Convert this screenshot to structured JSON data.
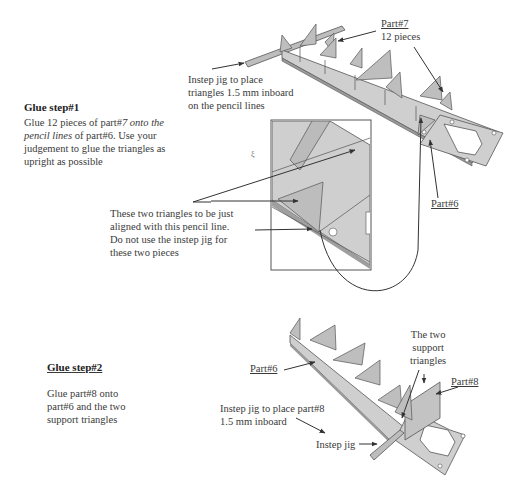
{
  "step1": {
    "title": "Glue step#1",
    "body_line1_a": "Glue 12 pieces of part#",
    "body_line1_b": "7 onto the",
    "body_line2_a": "pencil lines",
    "body_line2_b": " of part#6. Use your",
    "body_line3": "judgement to glue the triangles as",
    "body_line4": "upright as possible",
    "labels": {
      "jig_line1": "Instep jig to place",
      "jig_line2": "triangles 1.5 mm inboard",
      "jig_line3": "on the pencil lines",
      "part7": "Part#7",
      "part7_count": "12 pieces",
      "part6": "Part#6",
      "inset_note_line1": "These two triangles to be just",
      "inset_note_line2": "aligned with this pencil line.",
      "inset_note_line3": "Do not use the instep jig for",
      "inset_note_line4": "these two pieces"
    }
  },
  "step2": {
    "title": "Glue step#2",
    "body_line1": "Glue part#8 onto",
    "body_line2": "part#6 and the two",
    "body_line3": "support triangles",
    "labels": {
      "part6": "Part#6",
      "support_line1": "The two",
      "support_line2": "support",
      "support_line3": "triangles",
      "part8": "Part#8",
      "jig_line1": "Instep jig to place part#8",
      "jig_line2": "1.5 mm inboard",
      "instep_jig": "Instep jig"
    }
  },
  "colors": {
    "part_fill": "#c9c9c9",
    "part_edge": "#555555",
    "text": "#3a3a3a",
    "arrow": "#333333"
  }
}
